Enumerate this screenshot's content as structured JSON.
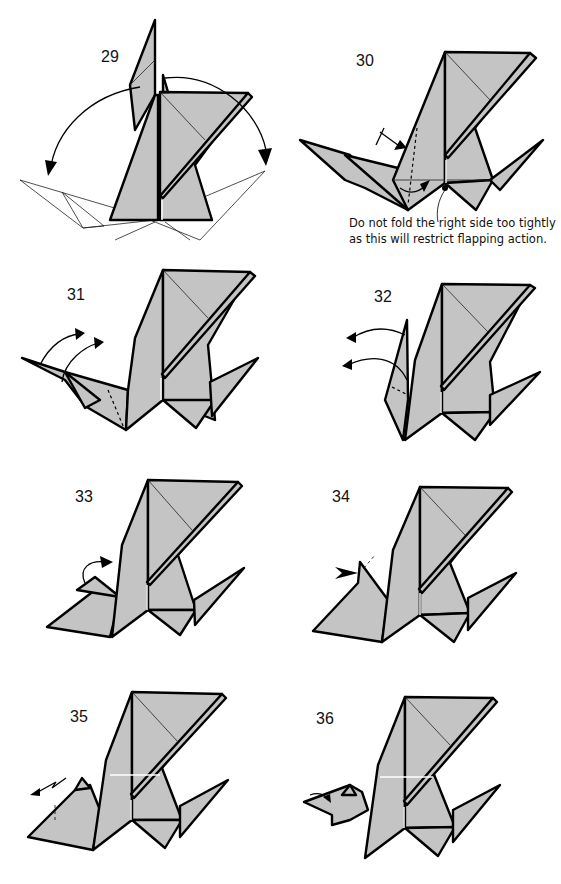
{
  "page": {
    "type": "origami-instructions",
    "fill_color": "#c4c4c4",
    "line_color": "#000000",
    "background": "#ffffff"
  },
  "steps": [
    {
      "number": "29",
      "description": "Swing both wings down (outline shows result)"
    },
    {
      "number": "30",
      "description": "Valley fold; do not crease right side",
      "note": "Do not fold the right side too tightly as this will restrict flapping action."
    },
    {
      "number": "31",
      "description": "Reverse fold head/neck up (two arrows)"
    },
    {
      "number": "32",
      "description": "Unfold layers back out (two arrows)"
    },
    {
      "number": "33",
      "description": "Fold head flap up"
    },
    {
      "number": "34",
      "description": "Push in (sink) at tip"
    },
    {
      "number": "35",
      "description": "Crimp / pleat head"
    },
    {
      "number": "36",
      "description": "Fold in tip; finished dragon"
    }
  ],
  "note_lines": [
    "Do not fold the right side too tightly",
    "as this will restrict flapping action."
  ]
}
